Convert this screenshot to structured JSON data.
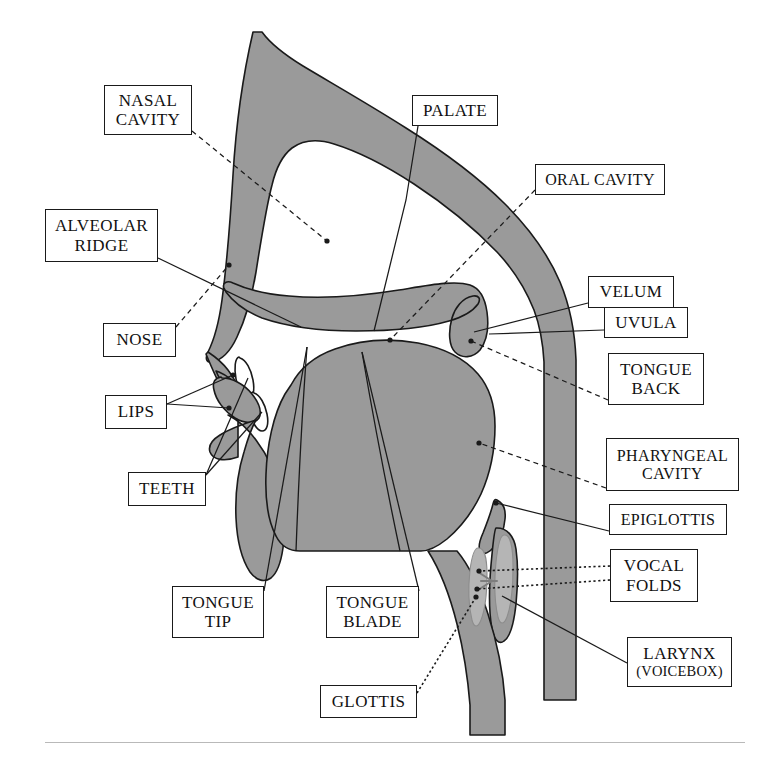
{
  "diagram": {
    "colors": {
      "tissue_fill": "#9a9a9a",
      "tissue_stroke": "#1a1a1a",
      "cavity_fill": "#ffffff",
      "vocal_fold_fill": "#b5b5b5",
      "leader_line": "#1a1a1a",
      "background": "#ffffff",
      "footer_rule": "#b9b9b9",
      "box_border": "#1a1a1a",
      "text": "#111111"
    },
    "labels": [
      {
        "id": "nasal-cavity",
        "lines": [
          "NASAL",
          "CAVITY"
        ],
        "x": 104,
        "y": 85,
        "w": 88,
        "h": 50,
        "leader": "dashed",
        "anchor": [
          192,
          131
        ],
        "target": [
          327,
          241
        ]
      },
      {
        "id": "palate",
        "lines": [
          "PALATE"
        ],
        "x": 412,
        "y": 95,
        "w": 86,
        "h": 31,
        "leader": "solid",
        "anchor": [
          420,
          126
        ],
        "target": [
          374,
          331
        ]
      },
      {
        "id": "oral-cavity",
        "lines": [
          "ORAL CAVITY"
        ],
        "x": 535,
        "y": 164,
        "w": 130,
        "h": 31,
        "leader": "dashed",
        "anchor": [
          535,
          190
        ],
        "target": [
          418,
          296
        ]
      },
      {
        "id": "alveolar-ridge",
        "lines": [
          "ALVEOLAR",
          "RIDGE"
        ],
        "x": 45,
        "y": 209,
        "w": 113,
        "h": 53,
        "leader": "solid",
        "anchor": [
          158,
          258
        ],
        "target": [
          301,
          327
        ]
      },
      {
        "id": "velum",
        "lines": [
          "VELUM"
        ],
        "x": 588,
        "y": 276,
        "w": 86,
        "h": 32,
        "leader": "solid",
        "anchor": [
          588,
          303
        ],
        "target": [
          474,
          330
        ]
      },
      {
        "id": "nose",
        "lines": [
          "NOSE"
        ],
        "x": 103,
        "y": 323,
        "w": 73,
        "h": 34,
        "leader": "dashed",
        "anchor": [
          176,
          327
        ],
        "target": [
          229,
          265
        ]
      },
      {
        "id": "uvula",
        "lines": [
          "UVULA"
        ],
        "x": 604,
        "y": 307,
        "w": 84,
        "h": 31,
        "leader": "solid",
        "anchor": [
          604,
          330
        ],
        "target": [
          491,
          334
        ]
      },
      {
        "id": "tongue-back",
        "lines": [
          "TONGUE",
          "BACK"
        ],
        "x": 608,
        "y": 353,
        "w": 96,
        "h": 52,
        "leader": "dashed",
        "anchor": [
          608,
          400
        ],
        "target": [
          471,
          341
        ]
      },
      {
        "id": "lips",
        "lines": [
          "LIPS"
        ],
        "x": 105,
        "y": 395,
        "w": 62,
        "h": 34,
        "leader": "solid",
        "anchor": [
          167,
          404
        ],
        "target": [
          233,
          375
        ]
      },
      {
        "id": "pharyngeal-cavity",
        "lines": [
          "PHARYNGEAL",
          "CAVITY"
        ],
        "x": 606,
        "y": 438,
        "w": 133,
        "h": 53,
        "leader": "dashed",
        "anchor": [
          606,
          488
        ],
        "target": [
          516,
          452
        ]
      },
      {
        "id": "teeth",
        "lines": [
          "TEETH"
        ],
        "x": 128,
        "y": 472,
        "w": 78,
        "h": 34,
        "leader": "solid",
        "anchor": [
          206,
          475
        ],
        "target": [
          247,
          395
        ]
      },
      {
        "id": "epiglottis",
        "lines": [
          "EPIGLOTTIS"
        ],
        "x": 609,
        "y": 504,
        "w": 118,
        "h": 31,
        "leader": "solid",
        "anchor": [
          609,
          531
        ],
        "target": [
          499,
          504
        ]
      },
      {
        "id": "vocal-folds",
        "lines": [
          "VOCAL",
          "FOLDS"
        ],
        "x": 610,
        "y": 549,
        "w": 88,
        "h": 53,
        "leader": "dotted",
        "anchor": [
          610,
          572
        ],
        "target": [
          487,
          578
        ]
      },
      {
        "id": "tongue-tip",
        "lines": [
          "TONGUE",
          "TIP"
        ],
        "x": 172,
        "y": 586,
        "w": 92,
        "h": 52,
        "leader": "solid",
        "anchor": [
          264,
          591
        ],
        "target": [
          307,
          347
        ]
      },
      {
        "id": "tongue-blade",
        "lines": [
          "TONGUE",
          "BLADE"
        ],
        "x": 326,
        "y": 586,
        "w": 93,
        "h": 52,
        "leader": "solid",
        "anchor": [
          419,
          591
        ],
        "target": [
          362,
          352
        ]
      },
      {
        "id": "larynx",
        "lines": [
          "LARYNX",
          "(VOICEBOX)"
        ],
        "x": 627,
        "y": 637,
        "w": 105,
        "h": 50,
        "leader": "solid",
        "anchor": [
          627,
          663
        ],
        "target": [
          492,
          592
        ]
      },
      {
        "id": "glottis",
        "lines": [
          "GLOTTIS"
        ],
        "x": 320,
        "y": 685,
        "w": 97,
        "h": 33,
        "leader": "dotted",
        "anchor": [
          417,
          693
        ],
        "target": [
          479,
          598
        ]
      }
    ],
    "regions": [
      {
        "id": "nasal-cavity-region",
        "name": "nasal cavity"
      },
      {
        "id": "oral-cavity-region",
        "name": "oral cavity"
      },
      {
        "id": "pharyngeal-cavity-region",
        "name": "pharyngeal cavity"
      },
      {
        "id": "tongue-region",
        "name": "tongue"
      },
      {
        "id": "velum-region",
        "name": "velum / soft palate"
      },
      {
        "id": "epiglottis-region",
        "name": "epiglottis"
      },
      {
        "id": "vocal-folds-region",
        "name": "vocal folds"
      },
      {
        "id": "teeth-region",
        "name": "teeth"
      },
      {
        "id": "lips-region",
        "name": "lips"
      },
      {
        "id": "trachea-region",
        "name": "trachea"
      }
    ]
  }
}
